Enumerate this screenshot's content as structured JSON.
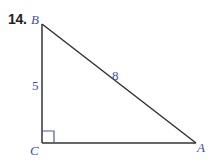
{
  "problem": {
    "number": "14."
  },
  "triangle": {
    "vertices": {
      "B": {
        "label": "B",
        "x": 42,
        "y": 24
      },
      "C": {
        "label": "C",
        "x": 42,
        "y": 143
      },
      "A": {
        "label": "A",
        "x": 196,
        "y": 143
      }
    },
    "sides": {
      "BC": {
        "label": "5"
      },
      "AB": {
        "label": "8"
      },
      "AC": {
        "label": ""
      }
    },
    "right_angle_at": "C"
  },
  "colors": {
    "line": "#333333",
    "label": "#3a4fa8",
    "number": "#222222"
  }
}
